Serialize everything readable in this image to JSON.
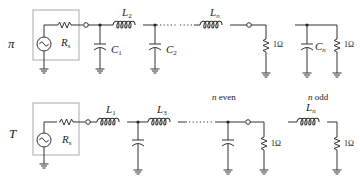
{
  "diagram": {
    "type": "ladder-filter-schematics",
    "rows": [
      {
        "id": "pi",
        "label": "π",
        "source": {
          "resistor_label": "R",
          "resistor_sub": "s"
        },
        "elements": [
          {
            "kind": "shunt-capacitor",
            "label": "C",
            "sub": "1"
          },
          {
            "kind": "series-inductor",
            "label": "L",
            "sub": "2"
          },
          {
            "kind": "shunt-capacitor",
            "label": "C",
            "sub": "2"
          },
          {
            "kind": "ellipsis"
          },
          {
            "kind": "series-inductor",
            "label": "L",
            "sub": "n"
          },
          {
            "kind": "load-resistor",
            "label": "1Ω"
          }
        ],
        "alt_termination": {
          "elements": [
            {
              "kind": "shunt-capacitor",
              "label": "C",
              "sub": "n"
            },
            {
              "kind": "load-resistor",
              "label": "1Ω"
            }
          ]
        }
      },
      {
        "id": "T",
        "label": "T",
        "source": {
          "resistor_label": "R",
          "resistor_sub": "s"
        },
        "elements": [
          {
            "kind": "series-inductor",
            "label": "L",
            "sub": "1"
          },
          {
            "kind": "shunt-capacitor"
          },
          {
            "kind": "series-inductor",
            "label": "L",
            "sub": "3"
          },
          {
            "kind": "ellipsis"
          },
          {
            "kind": "shunt-capacitor"
          },
          {
            "kind": "load-resistor",
            "label": "1Ω"
          }
        ],
        "even_note": "n even",
        "alt_termination": {
          "note": "n odd",
          "elements": [
            {
              "kind": "series-inductor",
              "label": "L",
              "sub": "n"
            },
            {
              "kind": "load-resistor",
              "label": "1Ω"
            }
          ]
        }
      }
    ]
  },
  "labels": {
    "pi_row": "π",
    "t_row": "T",
    "rs_main": "R",
    "rs_sub": "s",
    "L": "L",
    "C": "C",
    "sub_1": "1",
    "sub_2": "2",
    "sub_3": "3",
    "sub_n": "n",
    "ohm": "1Ω",
    "n_even": "n even",
    "n_odd": "n odd"
  }
}
